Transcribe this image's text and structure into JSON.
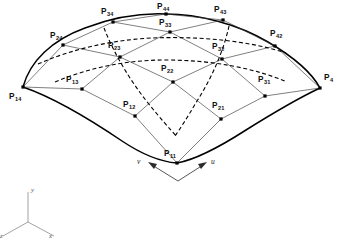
{
  "figure": {
    "type": "diagram",
    "width": 338,
    "height": 239,
    "background_color": "#ffffff",
    "line_colors": {
      "boundary_curve": "#000000",
      "control_polygon": "#3a3a3a",
      "isoparametric_dashed": "#000000",
      "control_point_dot": "#000000",
      "axis_triad": "#8a8a8a"
    }
  },
  "control_points": [
    {
      "name": "P11",
      "base": "P",
      "sub": "11",
      "x": 177,
      "y": 163,
      "label_x": 164,
      "label_y": 156,
      "anchor": "start"
    },
    {
      "name": "P12",
      "base": "P",
      "sub": "12",
      "x": 135,
      "y": 116,
      "label_x": 123,
      "label_y": 107,
      "anchor": "start"
    },
    {
      "name": "P13",
      "base": "P",
      "sub": "13",
      "x": 82,
      "y": 89,
      "label_x": 66,
      "label_y": 82,
      "anchor": "start"
    },
    {
      "name": "P14",
      "base": "P",
      "sub": "14",
      "x": 23,
      "y": 87,
      "label_x": 9,
      "label_y": 99,
      "anchor": "start"
    },
    {
      "name": "P21",
      "base": "P",
      "sub": "21",
      "x": 221,
      "y": 119,
      "label_x": 212,
      "label_y": 108,
      "anchor": "start"
    },
    {
      "name": "P22",
      "base": "P",
      "sub": "22",
      "x": 173,
      "y": 82,
      "label_x": 161,
      "label_y": 71,
      "anchor": "start"
    },
    {
      "name": "P23",
      "base": "P",
      "sub": "23",
      "x": 120,
      "y": 57,
      "label_x": 108,
      "label_y": 48,
      "anchor": "start"
    },
    {
      "name": "P24",
      "base": "P",
      "sub": "24",
      "x": 63,
      "y": 45,
      "label_x": 50,
      "label_y": 38,
      "anchor": "start"
    },
    {
      "name": "P31",
      "base": "P",
      "sub": "31",
      "x": 265,
      "y": 96,
      "label_x": 258,
      "label_y": 82,
      "anchor": "start"
    },
    {
      "name": "P32",
      "base": "P",
      "sub": "32",
      "x": 222,
      "y": 59,
      "label_x": 212,
      "label_y": 49,
      "anchor": "start"
    },
    {
      "name": "P33",
      "base": "P",
      "sub": "33",
      "x": 170,
      "y": 32,
      "label_x": 159,
      "label_y": 25,
      "anchor": "start"
    },
    {
      "name": "P34",
      "base": "P",
      "sub": "34",
      "x": 113,
      "y": 22,
      "label_x": 101,
      "label_y": 14,
      "anchor": "start"
    },
    {
      "name": "P41",
      "base": "P",
      "sub": "4",
      "x": 320,
      "y": 88,
      "label_x": 324,
      "label_y": 80,
      "anchor": "start"
    },
    {
      "name": "P42",
      "base": "P",
      "sub": "42",
      "x": 275,
      "y": 46,
      "label_x": 270,
      "label_y": 36,
      "anchor": "start"
    },
    {
      "name": "P43",
      "base": "P",
      "sub": "43",
      "x": 223,
      "y": 20,
      "label_x": 214,
      "label_y": 12,
      "anchor": "start"
    },
    {
      "name": "P44",
      "base": "P",
      "sub": "44",
      "x": 166,
      "y": 14,
      "label_x": 157,
      "label_y": 9,
      "anchor": "start"
    }
  ],
  "parameter_directions": [
    {
      "name": "v",
      "label": "v",
      "label_x": 137,
      "label_y": 163,
      "arrow_from_x": 178,
      "arrow_from_y": 180,
      "arrow_to_x": 149,
      "arrow_to_y": 163
    },
    {
      "name": "u",
      "label": "u",
      "label_x": 210,
      "label_y": 163,
      "arrow_from_x": 178,
      "arrow_from_y": 180,
      "arrow_to_x": 203,
      "arrow_to_y": 163
    }
  ],
  "axis_triad": {
    "origin_x": 28,
    "origin_y": 222,
    "axes": [
      {
        "name": "y-axis",
        "label": "y",
        "end_x": 28,
        "end_y": 192,
        "label_x": 31,
        "label_y": 191
      },
      {
        "name": "x-axis",
        "label": "x",
        "end_x": 53,
        "end_y": 236,
        "label_x": 48,
        "label_y": 236
      },
      {
        "name": "z-axis",
        "label": "z",
        "end_x": 3,
        "end_y": 236,
        "label_x": 0,
        "label_y": 237
      }
    ]
  },
  "curve_paths": {
    "boundary_front_left": "M 23 87 Q 70 111 120 142 Q 150 158 177 163",
    "boundary_front_right": "M 177 163 Q 208 156 245 135 Q 288 109 320 88",
    "boundary_back_left": "M 23 87 Q 38 52 80 32 Q 122 13 166 14",
    "boundary_back_right": "M 166 14 Q 215 15 262 34 Q 300 52 320 88"
  },
  "control_polygon_rows": [
    [
      "P11",
      "P12",
      "P13",
      "P14"
    ],
    [
      "P21",
      "P22",
      "P23",
      "P24"
    ],
    [
      "P31",
      "P32",
      "P33",
      "P34"
    ],
    [
      "P41",
      "P42",
      "P43",
      "P44"
    ]
  ]
}
